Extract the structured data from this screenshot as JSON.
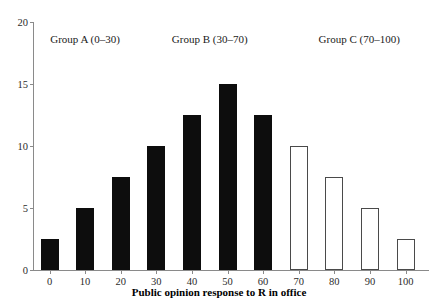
{
  "chart_data": {
    "type": "bar",
    "title": "",
    "subtitle": "",
    "xlabel": "Public opinion response to R in office",
    "ylabel": "",
    "categories": [
      "0",
      "10",
      "20",
      "30",
      "40",
      "50",
      "60",
      "70",
      "80",
      "90",
      "100"
    ],
    "values": [
      2.5,
      5,
      7.5,
      10,
      12.5,
      15,
      12.5,
      10,
      7.5,
      5,
      2.5
    ],
    "series": [
      {
        "name": "Public opinion response distribution",
        "values": [
          2.5,
          5,
          7.5,
          10,
          12.5,
          15,
          12.5,
          10,
          7.5,
          5,
          2.5
        ],
        "styles": [
          "filled",
          "filled",
          "filled",
          "filled",
          "filled",
          "filled",
          "filled",
          "open",
          "open",
          "open",
          "open"
        ]
      }
    ],
    "ylim": [
      0,
      20
    ],
    "yticks": [
      "0",
      "5",
      "10",
      "15",
      "20"
    ],
    "ytick_values": [
      0,
      5,
      10,
      15,
      20
    ],
    "xticks": [
      "0",
      "10",
      "20",
      "30",
      "40",
      "50",
      "60",
      "70",
      "80",
      "90",
      "100"
    ],
    "grid": false,
    "legend": "none",
    "legend_position": "none",
    "annotations": [
      {
        "label": "Group A (0–30)",
        "x_center": 10,
        "range": [
          0,
          30
        ]
      },
      {
        "label": "Group B (30–70)",
        "x_center": 45,
        "range": [
          30,
          70
        ]
      },
      {
        "label": "Group C (70–100)",
        "x_center": 87,
        "range": [
          70,
          100
        ]
      }
    ],
    "colors": {
      "filled_bar": "#0d0d0d",
      "open_bar_fill": "#ffffff",
      "open_bar_stroke": "#4a4a4a",
      "axis": "#8a8a8a",
      "text": "#1a1a1a",
      "background": "#ffffff"
    }
  }
}
